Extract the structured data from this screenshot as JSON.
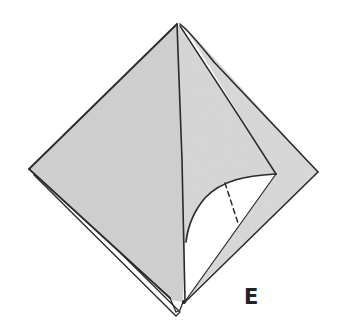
{
  "diagram": {
    "step_label": "E",
    "colors": {
      "paper_fill": "#d4d4d4",
      "paper_fill_light": "#e2e2e2",
      "line": "#2a2a2a",
      "background": "#ffffff",
      "label": "#222222"
    },
    "elements": [
      {
        "id": "outer-square",
        "type": "polygon",
        "desc": "folded paper base, diamond orientation"
      },
      {
        "id": "center-crease",
        "type": "line",
        "desc": "vertical crease from top apex to bottom point"
      },
      {
        "id": "right-flap-edge",
        "type": "line",
        "desc": "inner flap edge from apex to right inner point"
      },
      {
        "id": "curved-pocket",
        "type": "curve",
        "desc": "opened curved pocket revealing white interior"
      },
      {
        "id": "dashed-fold",
        "type": "dashed-line",
        "desc": "hidden fold line inside pocket"
      },
      {
        "id": "lower-left-layer",
        "type": "line",
        "desc": "offset back layer along lower-left edge"
      }
    ]
  }
}
